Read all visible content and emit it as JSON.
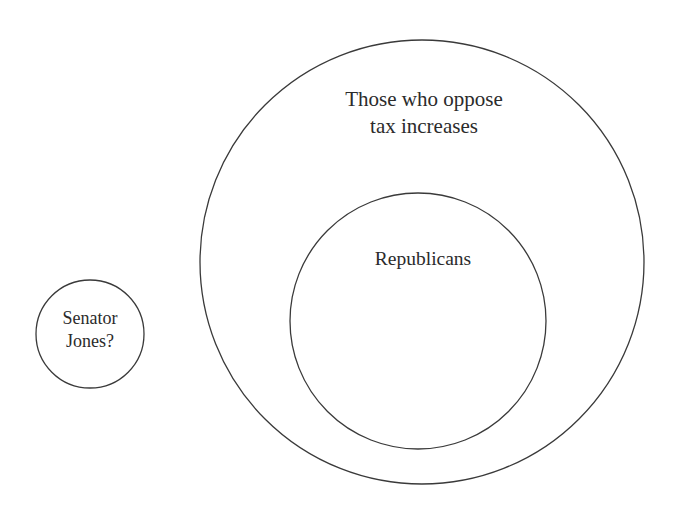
{
  "figure": {
    "type": "euler-diagram",
    "background_color": "#ffffff",
    "stroke_color": "#3a3a3a",
    "text_color": "#2b2b2b",
    "sets": [
      {
        "id": "outer",
        "label": "Those who oppose\ntax increases",
        "cx": 422,
        "cy": 262,
        "r": 222,
        "relation": "superset"
      },
      {
        "id": "inner",
        "label": "Republicans",
        "cx": 418,
        "cy": 321,
        "r": 128,
        "relation": "subset-of-outer"
      },
      {
        "id": "unknown",
        "label": "Senator\nJones?",
        "cx": 90,
        "cy": 334,
        "r": 54,
        "relation": "disjoint"
      }
    ]
  }
}
